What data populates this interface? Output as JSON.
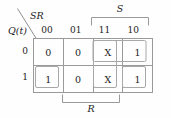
{
  "kmap": {
    "title": "Karnaugh map for SR latch next-state",
    "corner": {
      "column_variable": "SR",
      "row_variable": "Q(t)"
    },
    "column_headers": [
      "00",
      "01",
      "11",
      "10"
    ],
    "row_headers": [
      "0",
      "1"
    ],
    "cells": [
      [
        "0",
        "0",
        "X",
        "1"
      ],
      [
        "1",
        "0",
        "X",
        "1"
      ]
    ],
    "brackets": [
      {
        "label": "S",
        "position": "top",
        "spans_columns": [
          "11",
          "10"
        ]
      },
      {
        "label": "R",
        "position": "bottom",
        "spans_columns": [
          "01",
          "11"
        ]
      }
    ],
    "groups": [
      {
        "name": "group-row0-cols-11-10",
        "cells": [
          [
            0,
            2
          ],
          [
            0,
            3
          ]
        ]
      },
      {
        "name": "group-col-11-both-rows",
        "cells": [
          [
            0,
            2
          ],
          [
            1,
            2
          ]
        ]
      },
      {
        "name": "group-row1-col-00",
        "cells": [
          [
            1,
            0
          ]
        ]
      },
      {
        "name": "group-row1-col-10",
        "cells": [
          [
            1,
            3
          ]
        ]
      }
    ],
    "colors": {
      "grid_line": "#9a9a9a",
      "group_outline": "#a8a8a8",
      "text": "#1c1c1c",
      "background": "#fefefe"
    }
  }
}
